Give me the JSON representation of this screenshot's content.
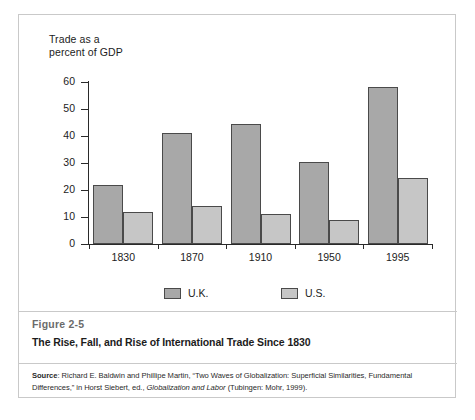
{
  "figure": {
    "number": "Figure 2-5",
    "title": "The Rise, Fall, and Rise of International Trade Since 1830",
    "source_label": "Source",
    "source_text_1": ": Richard E. Baldwin and Phillipe Martin, “Two Waves of Globalization: Superficial Similarities, Fundamental Differences,” in Horst Siebert, ed., ",
    "source_italic": "Globalization and Labor",
    "source_text_2": " (Tubingen: Mohr, 1999)."
  },
  "chart_data": {
    "type": "bar",
    "title": "The Rise, Fall, and Rise of International Trade Since 1830",
    "axis_title": "Trade as a\npercent of GDP",
    "xlabel": "",
    "ylabel": "Trade as a percent of GDP",
    "ylim": [
      0,
      60
    ],
    "yticks": [
      0,
      10,
      20,
      30,
      40,
      50,
      60
    ],
    "ytick_labels": [
      "0",
      "10",
      "20",
      "30",
      "40",
      "50",
      "60"
    ],
    "grid": false,
    "legend_position": "bottom",
    "categories": [
      "1830",
      "1870",
      "1910",
      "1950",
      "1995"
    ],
    "series": [
      {
        "name": "U.K.",
        "color": "#a8a8a8",
        "values": [
          22,
          41,
          44.5,
          30.5,
          58
        ]
      },
      {
        "name": "U.S.",
        "color": "#c6c6c6",
        "values": [
          12,
          14,
          11,
          9,
          24.5
        ]
      }
    ]
  }
}
